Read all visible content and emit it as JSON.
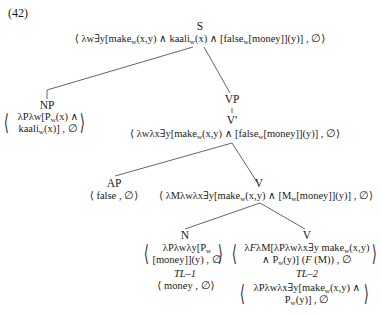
{
  "example_number": "(42)",
  "nodes": {
    "S": {
      "label": "S",
      "formula": "⟨ λw∃y[make_w(x,y) ∧ kaali_w(x) ∧ [false_w[money]](y)] , ∅⟩"
    },
    "NP": {
      "label": "NP",
      "formula_line1": "λPλw[P_w(x) ∧",
      "formula_line2": "kaali_w(x)] , ∅"
    },
    "VP": {
      "label": "VP"
    },
    "Vbar": {
      "label": "V'",
      "formula": "⟨ λwλx∃y[make_w(x,y) ∧ [false_w[money]](y)] , ∅⟩"
    },
    "AP": {
      "label": "AP",
      "formula": "⟨ false , ∅⟩"
    },
    "V1": {
      "label": "V",
      "formula": "⟨ λMλwλx∃y[make_w(x,y) ∧ [M_w[money]](y)] , ∅⟩"
    },
    "N": {
      "label": "N",
      "formula_line1": "λPλwλy[P_w",
      "formula_line2": "[money]](y) , ∅",
      "rule": "TL–1",
      "lexical": "⟨ money , ∅⟩"
    },
    "V2": {
      "label": "V",
      "formula_line1": "λFλM[λPλwλx∃y make_w(x,y)",
      "formula_line2": "∧ P_w(y)] (F (M)) , ∅",
      "rule": "TL–2",
      "lexical_line1": "λPλwλx∃y[make_w(x,y) ∧",
      "lexical_line2": "P_w(y)] , ∅"
    }
  },
  "edges": [
    {
      "from": "S",
      "to": "NP"
    },
    {
      "from": "S",
      "to": "VP"
    },
    {
      "from": "VP",
      "to": "V'"
    },
    {
      "from": "V'",
      "to": "AP"
    },
    {
      "from": "V'",
      "to": "V"
    },
    {
      "from": "V",
      "to": "N"
    },
    {
      "from": "V",
      "to": "V"
    }
  ],
  "colors": {
    "ink": "#1a1a1a",
    "edge": "#555555"
  }
}
